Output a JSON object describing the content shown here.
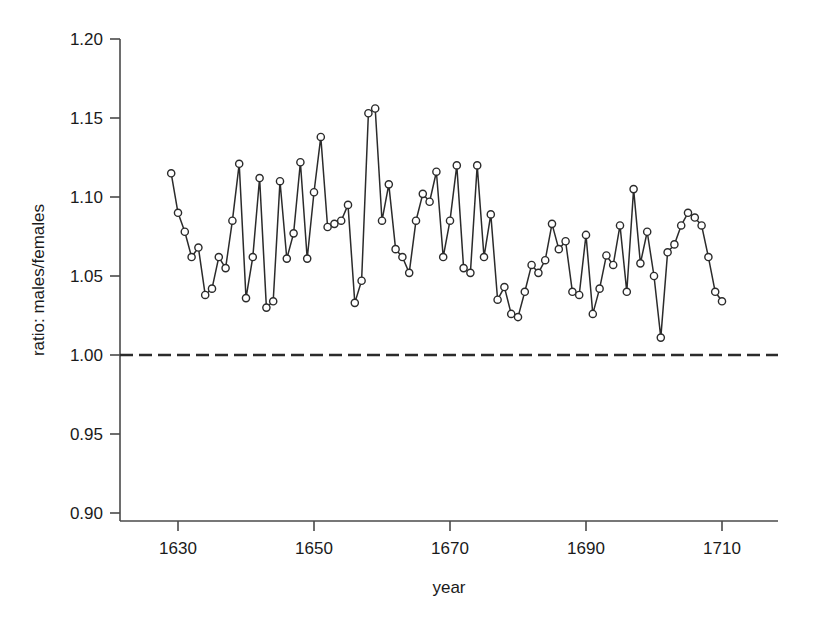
{
  "chart_data": {
    "type": "line",
    "title": "",
    "subtitle": "",
    "xlabel": "year",
    "ylabel": "ratio: males/females",
    "xlim": [
      1622,
      1718
    ],
    "ylim": [
      0.9,
      1.2
    ],
    "grid": false,
    "legend": "none",
    "xticks": [
      1630,
      1650,
      1670,
      1690,
      1710
    ],
    "xticklabels": [
      "1630",
      "1650",
      "1670",
      "1690",
      "1710"
    ],
    "yticks": [
      0.9,
      0.95,
      1.0,
      1.05,
      1.1,
      1.15,
      1.2
    ],
    "yticklabels": [
      "0.90",
      "0.95",
      "1.00",
      "1.05",
      "1.10",
      "1.15",
      "1.20"
    ],
    "annotations": [
      {
        "type": "hline",
        "y": 1.0,
        "style": "dashed",
        "label": "parity (ratio = 1.00)"
      }
    ],
    "markers": "open-circle",
    "series": [
      {
        "name": "christenings ratio",
        "x": [
          1629,
          1630,
          1631,
          1632,
          1633,
          1634,
          1635,
          1636,
          1637,
          1638,
          1639,
          1640,
          1641,
          1642,
          1643,
          1644,
          1645,
          1646,
          1647,
          1648,
          1649,
          1650,
          1651,
          1652,
          1653,
          1654,
          1655,
          1656,
          1657,
          1658,
          1659,
          1660,
          1661,
          1662,
          1663,
          1664,
          1665,
          1666,
          1667,
          1668,
          1669,
          1670,
          1671,
          1672,
          1673,
          1674,
          1675,
          1676,
          1677,
          1678,
          1679,
          1680,
          1681,
          1682,
          1683,
          1684,
          1685,
          1686,
          1687,
          1688,
          1689,
          1690,
          1691,
          1692,
          1693,
          1694,
          1695,
          1696,
          1697,
          1698,
          1699,
          1700,
          1701,
          1702,
          1703,
          1704,
          1705,
          1706,
          1707,
          1708,
          1709,
          1710
        ],
        "values": [
          1.115,
          1.09,
          1.078,
          1.062,
          1.068,
          1.038,
          1.042,
          1.062,
          1.055,
          1.085,
          1.121,
          1.036,
          1.062,
          1.112,
          1.03,
          1.034,
          1.11,
          1.061,
          1.077,
          1.122,
          1.061,
          1.103,
          1.138,
          1.081,
          1.083,
          1.085,
          1.095,
          1.033,
          1.047,
          1.153,
          1.156,
          1.085,
          1.108,
          1.067,
          1.062,
          1.052,
          1.085,
          1.102,
          1.097,
          1.116,
          1.062,
          1.085,
          1.12,
          1.055,
          1.052,
          1.12,
          1.062,
          1.089,
          1.035,
          1.043,
          1.026,
          1.024,
          1.04,
          1.057,
          1.052,
          1.06,
          1.083,
          1.067,
          1.072,
          1.04,
          1.038,
          1.076,
          1.026,
          1.042,
          1.063,
          1.057,
          1.082,
          1.04,
          1.105,
          1.058,
          1.078,
          1.05,
          1.011,
          1.065,
          1.07,
          1.082,
          1.09,
          1.087,
          1.082,
          1.062,
          1.04,
          1.034
        ]
      }
    ]
  },
  "axes": {
    "y_title": "ratio: males/females",
    "x_title": "year"
  }
}
